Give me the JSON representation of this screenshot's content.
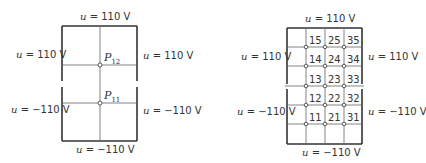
{
  "left_panel": {
    "top_label": {
      "var": "u",
      "eq": " = 110 V"
    },
    "bottom_label": {
      "var": "u",
      "eq": " = −110 V"
    },
    "left_upper_label": {
      "var": "u",
      "eq": " = 110 V"
    },
    "left_lower_label": {
      "var": "u",
      "eq": " = −110 V"
    },
    "right_upper_label": {
      "var": "u",
      "eq": " = 110 V"
    },
    "right_lower_label": {
      "var": "u",
      "eq": " = −110 V"
    },
    "points": [
      {
        "name": "P",
        "sub": "12"
      },
      {
        "name": "P",
        "sub": "11"
      }
    ]
  },
  "right_panel": {
    "top_label": {
      "var": "u",
      "eq": " = 110 V"
    },
    "bottom_label": {
      "var": "u",
      "eq": " = −110 V"
    },
    "left_upper_label": {
      "var": "u",
      "eq": " = 110 V"
    },
    "left_lower_label": {
      "var": "u",
      "eq": " = −110 V"
    },
    "right_upper_label": {
      "var": "u",
      "eq": " = 110 V"
    },
    "right_lower_label": {
      "var": "u",
      "eq": " = −110 V"
    },
    "grid_labels": [
      [
        "15",
        "25",
        "35"
      ],
      [
        "14",
        "24",
        "34"
      ],
      [
        "13",
        "23",
        "33"
      ],
      [
        "12",
        "22",
        "32"
      ],
      [
        "11",
        "21",
        "31"
      ]
    ]
  }
}
